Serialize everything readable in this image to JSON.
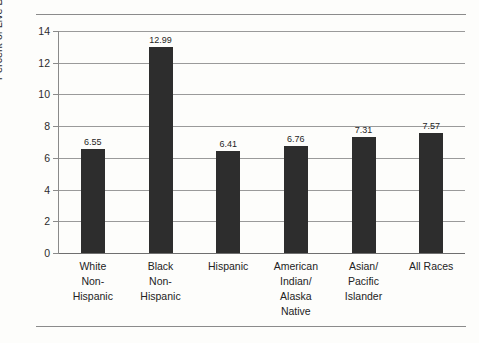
{
  "chart_data": {
    "type": "bar",
    "title": "",
    "subtitle": "",
    "xlabel": "",
    "ylabel": "Percent of Live Births",
    "ylim": [
      0,
      14
    ],
    "ytick_step": 2,
    "yticks": [
      "14",
      "12",
      "10",
      "8",
      "6",
      "4",
      "2",
      "0"
    ],
    "grid": true,
    "legend": false,
    "categories": [
      "White Non-Hispanic",
      "Black Non-Hispanic",
      "Hispanic",
      "American Indian/ Alaska Native",
      "Asian/ Pacific Islander",
      "All Races"
    ],
    "category_lines": [
      [
        "White",
        "Non-",
        "Hispanic"
      ],
      [
        "Black",
        "Non-",
        "Hispanic"
      ],
      [
        "Hispanic"
      ],
      [
        "American",
        "Indian/",
        "Alaska",
        "Native"
      ],
      [
        "Asian/",
        "Pacific",
        "Islander"
      ],
      [
        "All Races"
      ]
    ],
    "values": [
      6.55,
      12.99,
      6.41,
      6.76,
      7.31,
      7.57
    ],
    "value_labels": [
      "6.55",
      "12.99",
      "6.41",
      "6.76",
      "7.31",
      "7.57"
    ],
    "bar_color": "#2d2d2d",
    "grid_color": "#9a9a9a",
    "background_color": "#fdfdfb",
    "axis_color": "#8a8a8a"
  }
}
